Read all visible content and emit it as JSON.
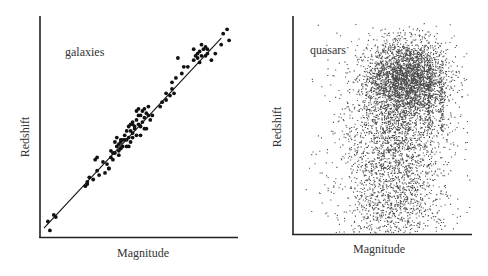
{
  "chart_data": [
    {
      "type": "scatter",
      "title": "",
      "annotation": "galaxies",
      "xlabel": "Magnitude",
      "ylabel": "Redshift",
      "xticks": [],
      "yticks": [],
      "grid": false,
      "legend": null,
      "xlim": [
        0,
        1
      ],
      "ylim": [
        0,
        1
      ],
      "fit_line": {
        "x": [
          0.02,
          0.92
        ],
        "y": [
          0.04,
          0.9
        ]
      },
      "points_normalized": [
        [
          0.05,
          0.03
        ],
        [
          0.04,
          0.07
        ],
        [
          0.07,
          0.1
        ],
        [
          0.08,
          0.09
        ],
        [
          0.23,
          0.23
        ],
        [
          0.24,
          0.24
        ],
        [
          0.25,
          0.27
        ],
        [
          0.24,
          0.25
        ],
        [
          0.27,
          0.26
        ],
        [
          0.29,
          0.3
        ],
        [
          0.3,
          0.28
        ],
        [
          0.32,
          0.34
        ],
        [
          0.29,
          0.36
        ],
        [
          0.34,
          0.33
        ],
        [
          0.35,
          0.31
        ],
        [
          0.36,
          0.36
        ],
        [
          0.37,
          0.35
        ],
        [
          0.38,
          0.38
        ],
        [
          0.36,
          0.39
        ],
        [
          0.35,
          0.31
        ],
        [
          0.4,
          0.39
        ],
        [
          0.4,
          0.42
        ],
        [
          0.42,
          0.41
        ],
        [
          0.41,
          0.4
        ],
        [
          0.41,
          0.43
        ],
        [
          0.44,
          0.44
        ],
        [
          0.45,
          0.41
        ],
        [
          0.43,
          0.44
        ],
        [
          0.45,
          0.45
        ],
        [
          0.46,
          0.43
        ],
        [
          0.46,
          0.48
        ],
        [
          0.47,
          0.47
        ],
        [
          0.47,
          0.45
        ],
        [
          0.48,
          0.5
        ],
        [
          0.49,
          0.46
        ],
        [
          0.48,
          0.49
        ],
        [
          0.47,
          0.51
        ],
        [
          0.49,
          0.53
        ],
        [
          0.5,
          0.51
        ],
        [
          0.51,
          0.5
        ],
        [
          0.5,
          0.55
        ],
        [
          0.52,
          0.52
        ],
        [
          0.51,
          0.55
        ],
        [
          0.53,
          0.54
        ],
        [
          0.52,
          0.57
        ],
        [
          0.54,
          0.56
        ],
        [
          0.55,
          0.55
        ],
        [
          0.53,
          0.49
        ],
        [
          0.55,
          0.59
        ],
        [
          0.54,
          0.49
        ],
        [
          0.56,
          0.53
        ],
        [
          0.57,
          0.55
        ],
        [
          0.51,
          0.46
        ],
        [
          0.47,
          0.52
        ],
        [
          0.44,
          0.41
        ],
        [
          0.42,
          0.44
        ],
        [
          0.39,
          0.45
        ],
        [
          0.37,
          0.38
        ],
        [
          0.38,
          0.43
        ],
        [
          0.41,
          0.44
        ],
        [
          0.39,
          0.41
        ],
        [
          0.53,
          0.58
        ],
        [
          0.5,
          0.58
        ],
        [
          0.49,
          0.57
        ],
        [
          0.61,
          0.59
        ],
        [
          0.62,
          0.61
        ],
        [
          0.64,
          0.62
        ],
        [
          0.64,
          0.65
        ],
        [
          0.66,
          0.64
        ],
        [
          0.67,
          0.67
        ],
        [
          0.68,
          0.65
        ],
        [
          0.67,
          0.7
        ],
        [
          0.69,
          0.72
        ],
        [
          0.72,
          0.74
        ],
        [
          0.73,
          0.77
        ],
        [
          0.7,
          0.81
        ],
        [
          0.75,
          0.77
        ],
        [
          0.78,
          0.8
        ],
        [
          0.79,
          0.82
        ],
        [
          0.8,
          0.81
        ],
        [
          0.8,
          0.83
        ],
        [
          0.81,
          0.84
        ],
        [
          0.82,
          0.82
        ],
        [
          0.81,
          0.79
        ],
        [
          0.83,
          0.85
        ],
        [
          0.84,
          0.82
        ],
        [
          0.82,
          0.87
        ],
        [
          0.84,
          0.86
        ],
        [
          0.85,
          0.85
        ],
        [
          0.78,
          0.85
        ],
        [
          0.85,
          0.83
        ],
        [
          0.89,
          0.83
        ],
        [
          0.87,
          0.8
        ],
        [
          0.93,
          0.92
        ],
        [
          0.92,
          0.87
        ],
        [
          0.95,
          0.94
        ],
        [
          0.96,
          0.89
        ],
        [
          0.44,
          0.48
        ],
        [
          0.45,
          0.5
        ],
        [
          0.46,
          0.51
        ],
        [
          0.43,
          0.46
        ],
        [
          0.4,
          0.37
        ],
        [
          0.33,
          0.29
        ],
        [
          0.28,
          0.35
        ]
      ],
      "frame_px": {
        "x0": 40,
        "y0": 16,
        "x1": 237,
        "y1": 237
      },
      "marker": {
        "r": 1.9,
        "color": "#111111"
      }
    },
    {
      "type": "scatter",
      "title": "",
      "annotation": "quasars",
      "xlabel": "Magnitude",
      "ylabel": "Redshift",
      "xticks": [],
      "yticks": [],
      "grid": false,
      "legend": null,
      "xlim": [
        0,
        1
      ],
      "ylim": [
        0,
        1
      ],
      "frame_px": {
        "x0": 293,
        "y0": 16,
        "x1": 472,
        "y1": 234
      },
      "marker": {
        "r": 0.55,
        "color": "#222222"
      },
      "clusters_normalized": [
        {
          "n": 2200,
          "cx": 0.64,
          "cy": 0.72,
          "sx": 0.11,
          "sy": 0.08
        },
        {
          "n": 1500,
          "cx": 0.61,
          "cy": 0.6,
          "sx": 0.14,
          "sy": 0.16
        },
        {
          "n": 1400,
          "cx": 0.56,
          "cy": 0.32,
          "sx": 0.14,
          "sy": 0.18
        },
        {
          "n": 400,
          "cx": 0.55,
          "cy": 0.1,
          "sx": 0.16,
          "sy": 0.08
        },
        {
          "n": 120,
          "cx": 0.55,
          "cy": 0.5,
          "sx": 0.3,
          "sy": 0.35
        }
      ],
      "vertical_streak": {
        "x": 0.76,
        "y0": 0.48,
        "y1": 0.78,
        "n": 120
      },
      "vertical_streak2": {
        "x": 0.83,
        "y0": 0.47,
        "y1": 0.72,
        "n": 80
      }
    }
  ],
  "left_chart": {
    "annotation": "galaxies",
    "xlabel": "Magnitude",
    "ylabel": "Redshift"
  },
  "right_chart": {
    "annotation": "quasars",
    "xlabel": "Magnitude",
    "ylabel": "Redshift"
  }
}
